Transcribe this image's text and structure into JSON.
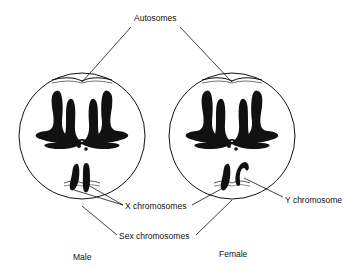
{
  "figure": {
    "labels": {
      "autosomes": "Autosomes",
      "x_chromosomes": "X chromosomes",
      "y_chromosome": "Y chromosome",
      "sex_chromosomes": "Sex chromosomes",
      "male": "Male",
      "female": "Female"
    },
    "cells": [
      {
        "name": "male-cell",
        "caption": "Male",
        "sex_chromosomes": [
          "X",
          "X"
        ]
      },
      {
        "name": "female-cell",
        "caption": "Female",
        "sex_chromosomes": [
          "X",
          "Y"
        ]
      }
    ],
    "colors": {
      "ink": "#111111",
      "background": "#ffffff"
    }
  }
}
